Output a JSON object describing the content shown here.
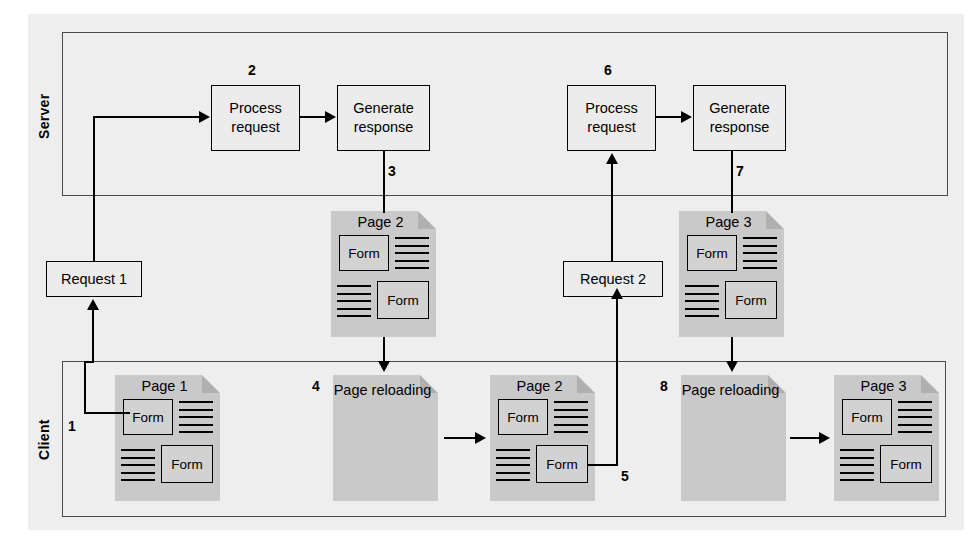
{
  "diagram": {
    "colors": {
      "page_background": "#ffffff",
      "canvas_background": "#eeeeee",
      "zone_border": "#4a4a4a",
      "document_fill": "#c9c9c9",
      "document_fold": "#b0b0b0",
      "box_fill": "#ececec",
      "form_fill": "#d2d2d2",
      "line": "#000000"
    },
    "zones": [
      {
        "id": "server",
        "label": "Server"
      },
      {
        "id": "client",
        "label": "Client"
      }
    ],
    "process_boxes": [
      {
        "id": "process-request-1",
        "step": "2",
        "line1": "Process",
        "line2": "request"
      },
      {
        "id": "generate-response-1",
        "step": "",
        "line1": "Generate",
        "line2": "response"
      },
      {
        "id": "process-request-2",
        "step": "6",
        "line1": "Process",
        "line2": "request"
      },
      {
        "id": "generate-response-2",
        "step": "",
        "line1": "Generate",
        "line2": "response"
      }
    ],
    "request_boxes": [
      {
        "id": "request-1",
        "label": "Request 1"
      },
      {
        "id": "request-2",
        "label": "Request 2"
      }
    ],
    "documents": [
      {
        "id": "server-page-2",
        "title": "Page 2",
        "kind": "page",
        "form_labels": [
          "Form",
          "Form"
        ]
      },
      {
        "id": "server-page-3",
        "title": "Page 3",
        "kind": "page",
        "form_labels": [
          "Form",
          "Form"
        ]
      },
      {
        "id": "client-page-1",
        "title": "Page 1",
        "kind": "page",
        "form_labels": [
          "Form",
          "Form"
        ]
      },
      {
        "id": "client-reloading-1",
        "title_line1": "Page",
        "title_line2": "reloading",
        "kind": "reloading"
      },
      {
        "id": "client-page-2",
        "title": "Page 2",
        "kind": "page",
        "form_labels": [
          "Form",
          "Form"
        ]
      },
      {
        "id": "client-reloading-2",
        "title_line1": "Page",
        "title_line2": "reloading",
        "kind": "reloading"
      },
      {
        "id": "client-page-3",
        "title": "Page 3",
        "kind": "page",
        "form_labels": [
          "Form",
          "Form"
        ]
      }
    ],
    "step_numbers": [
      {
        "id": "step-1",
        "label": "1"
      },
      {
        "id": "step-2",
        "label": "2"
      },
      {
        "id": "step-3",
        "label": "3"
      },
      {
        "id": "step-4",
        "label": "4"
      },
      {
        "id": "step-5",
        "label": "5"
      },
      {
        "id": "step-6",
        "label": "6"
      },
      {
        "id": "step-7",
        "label": "7"
      },
      {
        "id": "step-8",
        "label": "8"
      }
    ],
    "form_label": "Form"
  }
}
